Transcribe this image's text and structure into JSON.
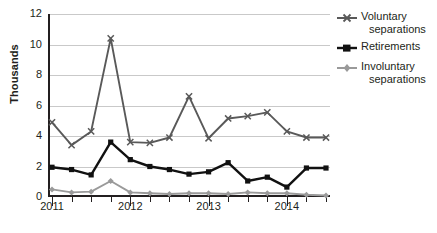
{
  "chart_data": {
    "type": "line",
    "title": "",
    "xlabel": "",
    "ylabel": "Thousands",
    "ylim": [
      0,
      12
    ],
    "yticks": [
      0,
      2,
      4,
      6,
      8,
      10,
      12
    ],
    "ytick_labels": [
      "0",
      "2",
      "4",
      "6",
      "8",
      "10",
      "12"
    ],
    "grid": true,
    "legend_position": "right",
    "x": [
      "2011 Q1",
      "2011 Q2",
      "2011 Q3",
      "2011 Q4",
      "2012 Q1",
      "2012 Q2",
      "2012 Q3",
      "2012 Q4",
      "2013 Q1",
      "2013 Q2",
      "2013 Q3",
      "2013 Q4",
      "2014 Q1",
      "2014 Q2",
      "2014 Q3"
    ],
    "xtick_labels": [
      "2011",
      "2012",
      "2013",
      "2014"
    ],
    "series": [
      {
        "name": "Voluntary separations",
        "name_line1": "Voluntary",
        "name_line2": "separations",
        "color": "#595959",
        "marker": "x",
        "values": [
          4.9,
          3.4,
          4.3,
          10.4,
          3.6,
          3.55,
          3.9,
          6.6,
          3.85,
          5.15,
          5.3,
          5.55,
          4.3,
          3.9,
          3.9
        ]
      },
      {
        "name": "Retirements",
        "name_line1": "Retirements",
        "name_line2": "",
        "color": "#111111",
        "marker": "square",
        "values": [
          1.95,
          1.8,
          1.45,
          3.6,
          2.45,
          2.0,
          1.8,
          1.5,
          1.65,
          2.25,
          1.05,
          1.3,
          0.65,
          1.9,
          1.9
        ]
      },
      {
        "name": "Involuntary separations",
        "name_line1": "Involuntary",
        "name_line2": "separations",
        "color": "#9a9a9a",
        "marker": "diamond",
        "values": [
          0.5,
          0.3,
          0.35,
          1.05,
          0.3,
          0.25,
          0.2,
          0.25,
          0.25,
          0.2,
          0.3,
          0.25,
          0.25,
          0.15,
          0.1
        ]
      }
    ]
  }
}
